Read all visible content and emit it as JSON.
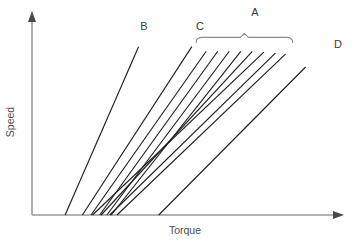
{
  "chart_data": {
    "type": "line",
    "title": "",
    "subtitle": "",
    "xlabel": "Torque",
    "ylabel": "Speed",
    "xlim": [
      0,
      100
    ],
    "ylim": [
      0,
      100
    ],
    "grid": false,
    "axis_ticks": false,
    "tick_labels_x": [],
    "tick_labels_y": [],
    "legend_position": "inline-end-labels",
    "annotations": [
      {
        "name": "group-brace-A",
        "label": "A",
        "type": "brace",
        "covers": [
          "line-a-1",
          "line-a-2",
          "line-a-3",
          "line-a-4",
          "line-a-5",
          "line-a-6",
          "line-a-7",
          "line-a-8"
        ],
        "span_x": [
          57.0,
          90.5
        ],
        "y": 96.0
      }
    ],
    "series": [
      {
        "name": "B",
        "label": "B",
        "x": [
          11.5,
          37.0
        ],
        "y": [
          0.0,
          91.0
        ],
        "label_x": 38.5,
        "label_y": 96.5,
        "group": "B"
      },
      {
        "name": "C",
        "label": "C",
        "x": [
          17.5,
          55.5
        ],
        "y": [
          0.0,
          91.0
        ],
        "label_x": 54.0,
        "label_y": 96.5,
        "group": "C"
      },
      {
        "name": "line-a-1",
        "label": "",
        "x": [
          20.5,
          60.5
        ],
        "y": [
          0.0,
          88.5
        ],
        "group": "A"
      },
      {
        "name": "line-a-2",
        "label": "",
        "x": [
          23.5,
          64.5
        ],
        "y": [
          0.0,
          88.5
        ],
        "group": "A"
      },
      {
        "name": "line-a-3",
        "label": "",
        "x": [
          26.0,
          68.5
        ],
        "y": [
          0.0,
          88.5
        ],
        "group": "A"
      },
      {
        "name": "line-a-4",
        "label": "",
        "x": [
          27.5,
          72.5
        ],
        "y": [
          0.0,
          88.5
        ],
        "group": "A"
      },
      {
        "name": "line-a-5",
        "label": "",
        "x": [
          24.0,
          76.5
        ],
        "y": [
          0.0,
          88.5
        ],
        "group": "A"
      },
      {
        "name": "line-a-6",
        "label": "",
        "x": [
          21.0,
          80.5
        ],
        "y": [
          0.0,
          88.0
        ],
        "group": "A"
      },
      {
        "name": "line-a-7",
        "label": "",
        "x": [
          27.0,
          84.5
        ],
        "y": [
          0.0,
          87.5
        ],
        "group": "A"
      },
      {
        "name": "line-a-8",
        "label": "",
        "x": [
          29.5,
          88.0
        ],
        "y": [
          0.0,
          87.0
        ],
        "group": "A"
      },
      {
        "name": "D",
        "label": "D",
        "x": [
          44.0,
          95.0
        ],
        "y": [
          0.0,
          80.0
        ],
        "label_x": 96.0,
        "label_y": 84.0,
        "group": "D"
      }
    ]
  },
  "figure": {
    "xlabel": "Torque",
    "ylabel": "Speed",
    "labels": {
      "a": "A",
      "b": "B",
      "c": "C",
      "d": "D"
    }
  }
}
